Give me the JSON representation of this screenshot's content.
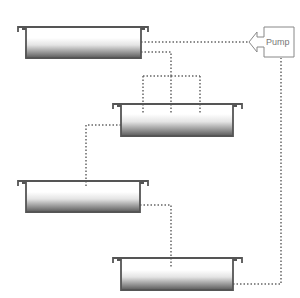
{
  "diagram": {
    "type": "tank-flow",
    "pump": {
      "label": "Pump"
    },
    "tanks": [
      {
        "id": "tank-1",
        "position": "top-left"
      },
      {
        "id": "tank-2",
        "position": "middle-right"
      },
      {
        "id": "tank-3",
        "position": "lower-left"
      },
      {
        "id": "tank-4",
        "position": "bottom-right"
      }
    ],
    "colors": {
      "line": "#555555",
      "fill_top": "#ffffff",
      "fill_bottom": "#555555",
      "dotted": "#666666"
    }
  }
}
